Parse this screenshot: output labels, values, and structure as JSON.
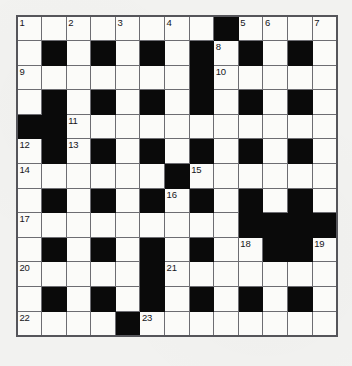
{
  "puzzle": {
    "type": "crossword-grid",
    "title": "Crossword Puzzle Grid",
    "rows": 13,
    "columns": 13,
    "cell_size_px": 24.6,
    "colors": {
      "page_background": "#f2f2f0",
      "cell_fill": "#fbfbf9",
      "block_fill": "#0a0a0a",
      "grid_line": "#6d6d72",
      "outer_border": "#55555a",
      "number_text": "#15151a"
    },
    "highest_clue_number": 23,
    "grid": [
      [
        "O",
        "O",
        "O",
        "O",
        "O",
        "O",
        "O",
        "O",
        "X",
        "O",
        "O",
        "O",
        "O"
      ],
      [
        "O",
        "X",
        "O",
        "X",
        "O",
        "X",
        "O",
        "X",
        "O",
        "X",
        "O",
        "X",
        "O"
      ],
      [
        "O",
        "O",
        "O",
        "O",
        "O",
        "O",
        "O",
        "X",
        "O",
        "O",
        "O",
        "O",
        "O"
      ],
      [
        "O",
        "X",
        "O",
        "X",
        "O",
        "X",
        "O",
        "X",
        "O",
        "X",
        "O",
        "X",
        "O"
      ],
      [
        "X",
        "X",
        "O",
        "O",
        "O",
        "O",
        "O",
        "O",
        "O",
        "O",
        "O",
        "O",
        "O"
      ],
      [
        "O",
        "X",
        "O",
        "X",
        "O",
        "X",
        "O",
        "X",
        "O",
        "X",
        "O",
        "X",
        "O"
      ],
      [
        "O",
        "O",
        "O",
        "O",
        "O",
        "O",
        "X",
        "O",
        "O",
        "O",
        "O",
        "O",
        "O"
      ],
      [
        "O",
        "X",
        "O",
        "X",
        "O",
        "X",
        "O",
        "X",
        "O",
        "X",
        "O",
        "X",
        "O"
      ],
      [
        "O",
        "O",
        "O",
        "O",
        "O",
        "O",
        "O",
        "O",
        "O",
        "X",
        "X",
        "X",
        "X"
      ],
      [
        "O",
        "X",
        "O",
        "X",
        "O",
        "X",
        "O",
        "X",
        "O",
        "O",
        "X",
        "X",
        "O"
      ],
      [
        "O",
        "O",
        "O",
        "O",
        "O",
        "X",
        "O",
        "O",
        "O",
        "O",
        "O",
        "O",
        "O"
      ],
      [
        "O",
        "X",
        "O",
        "X",
        "O",
        "X",
        "O",
        "X",
        "O",
        "X",
        "O",
        "X",
        "O"
      ],
      [
        "O",
        "O",
        "O",
        "O",
        "X",
        "O",
        "O",
        "O",
        "O",
        "O",
        "O",
        "O",
        "O"
      ]
    ],
    "numbers": [
      {
        "number": 1,
        "row": 0,
        "col": 0
      },
      {
        "number": 2,
        "row": 0,
        "col": 2
      },
      {
        "number": 3,
        "row": 0,
        "col": 4
      },
      {
        "number": 4,
        "row": 0,
        "col": 6
      },
      {
        "number": 5,
        "row": 0,
        "col": 9
      },
      {
        "number": 6,
        "row": 0,
        "col": 10
      },
      {
        "number": 7,
        "row": 0,
        "col": 12
      },
      {
        "number": 8,
        "row": 1,
        "col": 8
      },
      {
        "number": 9,
        "row": 2,
        "col": 0
      },
      {
        "number": 10,
        "row": 2,
        "col": 8
      },
      {
        "number": 11,
        "row": 4,
        "col": 2
      },
      {
        "number": 12,
        "row": 5,
        "col": 0
      },
      {
        "number": 13,
        "row": 5,
        "col": 2
      },
      {
        "number": 14,
        "row": 6,
        "col": 0
      },
      {
        "number": 15,
        "row": 6,
        "col": 7
      },
      {
        "number": 16,
        "row": 7,
        "col": 6
      },
      {
        "number": 17,
        "row": 8,
        "col": 0
      },
      {
        "number": 18,
        "row": 9,
        "col": 9
      },
      {
        "number": 19,
        "row": 9,
        "col": 12
      },
      {
        "number": 20,
        "row": 10,
        "col": 0
      },
      {
        "number": 21,
        "row": 10,
        "col": 6
      },
      {
        "number": 22,
        "row": 12,
        "col": 0
      },
      {
        "number": 23,
        "row": 12,
        "col": 5
      }
    ],
    "letters": []
  }
}
